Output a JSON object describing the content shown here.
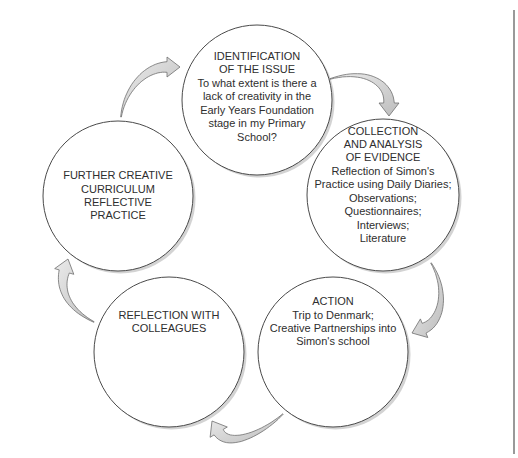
{
  "nodes": [
    {
      "id": "identification",
      "lines": [
        "IDENTIFICATION",
        "OF THE ISSUE",
        "To what extent is there a",
        "lack of creativity in the",
        "Early Years Foundation",
        "stage in my Primary",
        "School?"
      ]
    },
    {
      "id": "collection",
      "lines": [
        "COLLECTION",
        "AND ANALYSIS",
        "OF EVIDENCE",
        "Reflection of Simon's",
        "Practice using Daily Diaries;",
        "Observations;",
        "Questionnaires;",
        "Interviews;",
        "Literature"
      ]
    },
    {
      "id": "action",
      "lines": [
        "ACTION",
        "Trip to Denmark;",
        "Creative Partnerships into",
        "Simon's school"
      ]
    },
    {
      "id": "reflection",
      "lines": [
        "REFLECTION WITH",
        "COLLEAGUES"
      ]
    },
    {
      "id": "further",
      "lines": [
        "FURTHER CREATIVE",
        "CURRICULUM",
        "REFLECTIVE",
        "PRACTICE"
      ]
    }
  ],
  "arrows": [
    {
      "from": "identification",
      "to": "collection"
    },
    {
      "from": "collection",
      "to": "action"
    },
    {
      "from": "action",
      "to": "reflection"
    },
    {
      "from": "reflection",
      "to": "further"
    },
    {
      "from": "further",
      "to": "identification"
    }
  ],
  "colors": {
    "circle_stroke": "#4a4a4a",
    "circle_shadow": "#c8c8c8",
    "arrow_fill": "#d6d6d6",
    "arrow_stroke": "#6e6e6e",
    "text": "#2e2e2e",
    "frame_line": "#555555"
  }
}
